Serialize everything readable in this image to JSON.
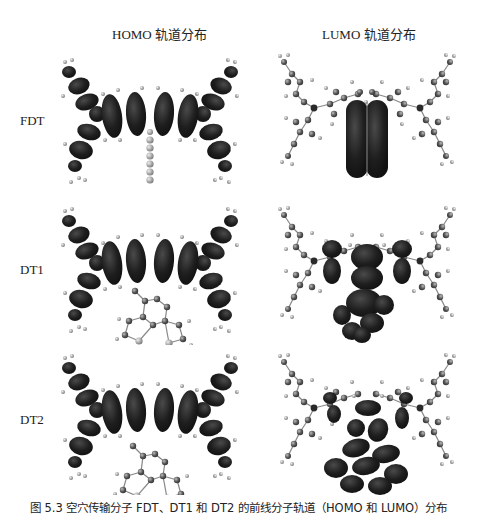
{
  "figure": {
    "column_headers": [
      "HOMO 轨道分布",
      "LUMO 轨道分布"
    ],
    "row_labels": [
      "FDT",
      "DT1",
      "DT2"
    ],
    "caption": "图 5.3   空穴传输分子 FDT、DT1 和 DT2 的前线分子轨道（HOMO 和 LUMO）分布",
    "panels": [
      {
        "molecule": "FDT",
        "orbital": "HOMO",
        "description": "dark lobes across central carbazole wings and side arms; central spiro axis uncovered"
      },
      {
        "molecule": "FDT",
        "orbital": "LUMO",
        "description": "dark lobes concentrated on central vertical fluorene core"
      },
      {
        "molecule": "DT1",
        "orbital": "HOMO",
        "description": "dark lobes across wings; lower fused core uncovered"
      },
      {
        "molecule": "DT1",
        "orbital": "LUMO",
        "description": "dark lobes on central core and lower fused rings"
      },
      {
        "molecule": "DT2",
        "orbital": "HOMO",
        "description": "dark lobes across wings; lower fused core uncovered"
      },
      {
        "molecule": "DT2",
        "orbital": "LUMO",
        "description": "dark lobes on central core and lower fused rings"
      }
    ],
    "colors": {
      "orbital_lobe": "#1e1e1e",
      "atom_carbon": "#555555",
      "atom_hydrogen": "#9a9a9a",
      "background": "#ffffff"
    }
  }
}
